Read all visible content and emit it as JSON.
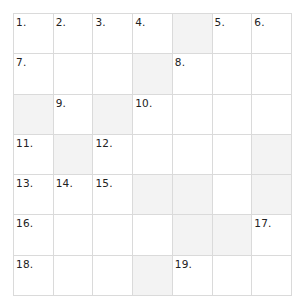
{
  "puzzle": {
    "rows": 7,
    "cols": 7,
    "colors": {
      "block": "#f3f3f3",
      "cell": "#ffffff",
      "grid_line": "#dadada",
      "number": "#222222"
    },
    "grid": [
      [
        {
          "n": "1."
        },
        {
          "n": "2."
        },
        {
          "n": "3."
        },
        {
          "n": "4."
        },
        {
          "block": true
        },
        {
          "n": "5."
        },
        {
          "n": "6."
        }
      ],
      [
        {
          "n": "7."
        },
        {},
        {},
        {
          "block": true
        },
        {
          "n": "8."
        },
        {},
        {}
      ],
      [
        {
          "block": true
        },
        {
          "n": "9."
        },
        {
          "block": true
        },
        {
          "n": "10."
        },
        {},
        {},
        {}
      ],
      [
        {
          "n": "11."
        },
        {
          "block": true
        },
        {
          "n": "12."
        },
        {},
        {},
        {},
        {
          "block": true
        }
      ],
      [
        {
          "n": "13."
        },
        {
          "n": "14."
        },
        {
          "n": "15."
        },
        {
          "block": true
        },
        {
          "block": true
        },
        {},
        {
          "block": true
        }
      ],
      [
        {
          "n": "16."
        },
        {},
        {},
        {},
        {
          "block": true
        },
        {
          "block": true
        },
        {
          "n": "17."
        }
      ],
      [
        {
          "n": "18."
        },
        {},
        {},
        {
          "block": true
        },
        {
          "n": "19."
        },
        {},
        {}
      ]
    ]
  }
}
